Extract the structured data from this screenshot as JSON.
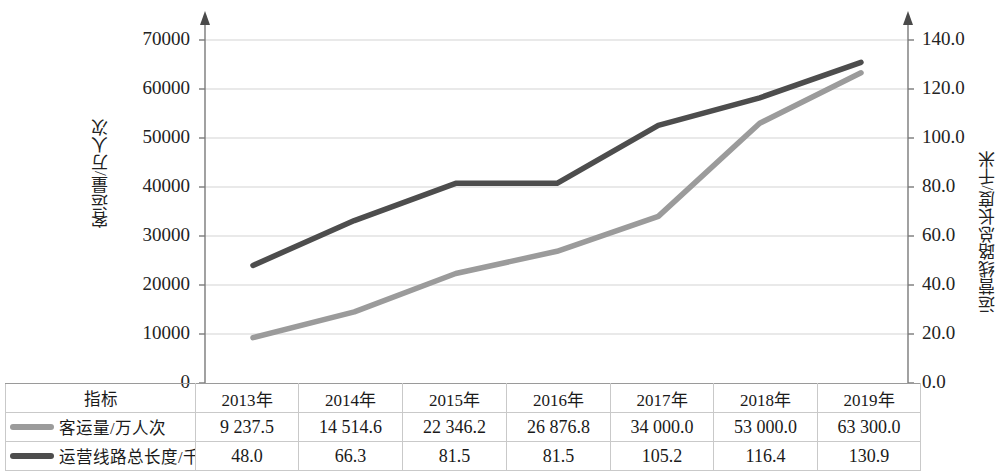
{
  "chart_data": {
    "type": "line",
    "title": "",
    "categories": [
      "2013年",
      "2014年",
      "2015年",
      "2016年",
      "2017年",
      "2018年",
      "2019年"
    ],
    "series": [
      {
        "name": "客运量/万人次",
        "axis": "left",
        "color": "#9b9b9b",
        "values": [
          9237.5,
          14514.6,
          22346.2,
          26876.8,
          34000.0,
          53000.0,
          63300.0
        ],
        "value_labels": [
          "9 237.5",
          "14 514.6",
          "22 346.2",
          "26 876.8",
          "34 000.0",
          "53 000.0",
          "63 300.0"
        ]
      },
      {
        "name": "运营线路总长度/千米",
        "axis": "right",
        "color": "#4d4d4d",
        "values": [
          48.0,
          66.3,
          81.5,
          81.5,
          105.2,
          116.4,
          130.9
        ],
        "value_labels": [
          "48.0",
          "66.3",
          "81.5",
          "81.5",
          "105.2",
          "116.4",
          "130.9"
        ]
      }
    ],
    "xlabel": "",
    "ylabel": "客运量/万人次",
    "y2label": "运营线路总长度/千米",
    "ylim": [
      0,
      70000
    ],
    "y2lim": [
      0,
      140
    ],
    "y_ticks": [
      0,
      10000,
      20000,
      30000,
      40000,
      50000,
      60000,
      70000
    ],
    "y_tick_labels": [
      "0",
      "10000",
      "20000",
      "30000",
      "40000",
      "50000",
      "60000",
      "70000"
    ],
    "y2_ticks": [
      0,
      20,
      40,
      60,
      80,
      100,
      120,
      140
    ],
    "y2_tick_labels": [
      "0.0",
      "20.0",
      "40.0",
      "60.0",
      "80.0",
      "100.0",
      "120.0",
      "140.0"
    ],
    "grid": true,
    "legend_position": "table"
  },
  "axes": {
    "left_title": "客运量/万人次",
    "right_title": "运营线路总长度/千米"
  },
  "table": {
    "indicator_header": "指标",
    "year_headers": [
      "2013年",
      "2014年",
      "2015年",
      "2016年",
      "2017年",
      "2018年",
      "2019年"
    ],
    "rows": [
      {
        "label": "客运量/万人次",
        "swatch_color": "#9b9b9b",
        "values": [
          "9 237.5",
          "14 514.6",
          "22 346.2",
          "26 876.8",
          "34 000.0",
          "53 000.0",
          "63 300.0"
        ]
      },
      {
        "label": "运营线路总长度/千米",
        "swatch_color": "#4d4d4d",
        "values": [
          "48.0",
          "66.3",
          "81.5",
          "81.5",
          "105.2",
          "116.4",
          "130.9"
        ]
      }
    ]
  }
}
